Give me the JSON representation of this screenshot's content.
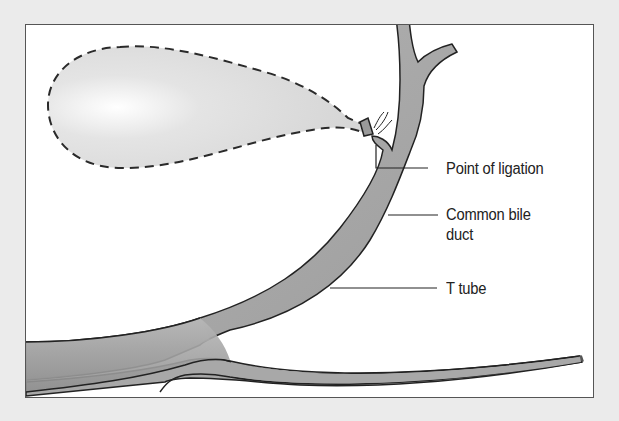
{
  "figure": {
    "colors": {
      "background": "#ebebeb",
      "panel": "#ffffff",
      "frame": "#555555",
      "duct_fill": "#a8a8a8",
      "duct_outline": "#2a2a2a",
      "gallbladder_fill": "#dcdcdc",
      "label_text": "#222222",
      "leader_line": "#222222"
    },
    "labels": [
      {
        "id": "point-of-ligation",
        "text": "Point of ligation"
      },
      {
        "id": "common-bile-duct",
        "line1": "Common bile",
        "line2": "duct"
      },
      {
        "id": "t-tube",
        "text": "T tube"
      }
    ]
  }
}
